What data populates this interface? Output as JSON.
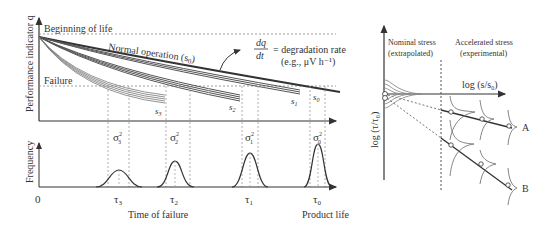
{
  "left_panel": {
    "y_axis_label": "Performance indicator q",
    "beginning_label": "Beginning of life",
    "failure_label": "Failure",
    "normal_operation_label": "Normal operation (s",
    "normal_operation_sub": "0",
    "equation": {
      "numerator": "dq",
      "denominator": "dt",
      "equals": "= degradation rate",
      "example": "(e.g., μV h⁻¹)"
    },
    "curve_labels": [
      {
        "name": "s",
        "sub": "3"
      },
      {
        "name": "s",
        "sub": "2"
      },
      {
        "name": "s",
        "sub": "1"
      },
      {
        "name": "s",
        "sub": "0"
      }
    ],
    "freq_axis_label": "Frequency",
    "variance_labels": [
      {
        "sym": "σ",
        "sup": "2",
        "sub": "3"
      },
      {
        "sym": "σ",
        "sup": "2",
        "sub": "2"
      },
      {
        "sym": "σ",
        "sup": "2",
        "sub": "1"
      },
      {
        "sym": "σ",
        "sup": "2",
        "sub": "0"
      }
    ],
    "x_ticks": [
      {
        "label": "0"
      },
      {
        "sym": "τ",
        "sub": "3"
      },
      {
        "sym": "τ",
        "sub": "2"
      },
      {
        "sym": "τ",
        "sub": "1"
      },
      {
        "sym": "τ",
        "sub": "0"
      }
    ],
    "time_of_failure_label": "Time of failure",
    "product_life_label": "Product life"
  },
  "right_panel": {
    "nominal_line1": "Nominal stress",
    "nominal_line2": "(extrapolated)",
    "accelerated_line1": "Accelerated stress",
    "accelerated_line2": "(experimental)",
    "x_axis_label": "log (s/s",
    "x_axis_sub": "0",
    "x_axis_close": ")",
    "y_axis_label": "log (τ/τ₀)",
    "line_labels": [
      "A",
      "B"
    ]
  },
  "colors": {
    "ink": "#333333",
    "light_ink": "#777777",
    "curve_gray": "#888888"
  }
}
